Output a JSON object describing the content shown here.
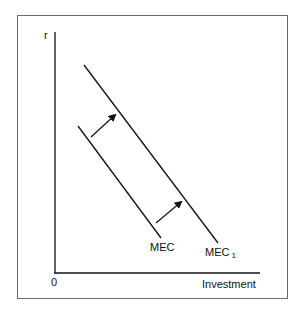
{
  "diagram": {
    "y_axis_label": "r",
    "x_axis_label": "Investment",
    "origin_label": "0",
    "curves": [
      {
        "name": "MEC",
        "label": "MEC",
        "subscript": ""
      },
      {
        "name": "MEC1",
        "label": "MEC",
        "subscript": "1"
      }
    ],
    "shift_direction": "rightward",
    "colors": {
      "line": "#111111",
      "frame": "#6a6a6a",
      "background": "#ffffff"
    }
  }
}
